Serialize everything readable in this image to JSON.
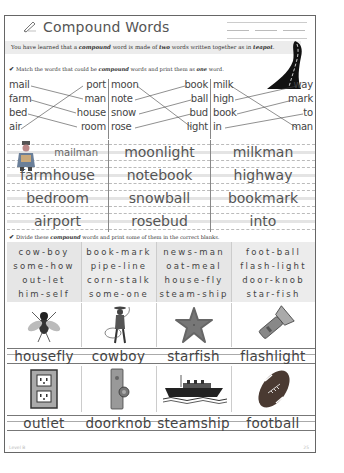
{
  "header": {
    "title": "Compound Words",
    "title_icon": "pencil-icon"
  },
  "intro": {
    "prefix": "You have learned that a ",
    "bold1": "compound",
    "middle": " word is made of ",
    "bold2": "two",
    "suffix": " words written together as in ",
    "bold3": "teapot",
    "end": "."
  },
  "instructions": {
    "match": {
      "check": "✔",
      "prefix": "Match the words that could be ",
      "bold1": "compound",
      "middle": " words and print them as ",
      "bold2": "one",
      "suffix": " word."
    },
    "divide": {
      "check": "✔",
      "prefix": "Divide these ",
      "bold1": "compound",
      "suffix": " words and print some of them in the correct blanks."
    }
  },
  "matching": {
    "columns": [
      {
        "left": [
          "mail",
          "farm",
          "bed",
          "air"
        ],
        "right": [
          "port",
          "man",
          "house",
          "room"
        ],
        "links": [
          [
            0,
            1
          ],
          [
            1,
            2
          ],
          [
            2,
            3
          ],
          [
            3,
            0
          ]
        ]
      },
      {
        "left": [
          "moon",
          "note",
          "snow",
          "rose"
        ],
        "right": [
          "book",
          "ball",
          "bud",
          "light"
        ],
        "links": [
          [
            0,
            3
          ],
          [
            1,
            0
          ],
          [
            2,
            1
          ],
          [
            3,
            2
          ]
        ]
      },
      {
        "left": [
          "milk",
          "high",
          "book",
          "in"
        ],
        "right": [
          "way",
          "mark",
          "to",
          "man"
        ],
        "links": [
          [
            0,
            3
          ],
          [
            1,
            0
          ],
          [
            2,
            1
          ],
          [
            3,
            2
          ]
        ]
      }
    ]
  },
  "answers": {
    "columns": [
      [
        "mailman",
        "farmhouse",
        "bedroom",
        "airport"
      ],
      [
        "moonlight",
        "notebook",
        "snowball",
        "rosebud"
      ],
      [
        "milkman",
        "highway",
        "bookmark",
        "into"
      ]
    ]
  },
  "divide": {
    "columns": [
      [
        "cow-boy",
        "some-how",
        "out-let",
        "him-self"
      ],
      [
        "book-mark",
        "pipe-line",
        "corn-stalk",
        "some-one"
      ],
      [
        "news-man",
        "oat-meal",
        "house-fly",
        "steam-ship"
      ],
      [
        "foot-ball",
        "flash-light",
        "door-knob",
        "star-fish"
      ]
    ]
  },
  "pictures": {
    "row1": [
      {
        "icon": "housefly-icon",
        "answer": "housefly"
      },
      {
        "icon": "cowboy-icon",
        "answer": "cowboy"
      },
      {
        "icon": "starfish-icon",
        "answer": "starfish"
      },
      {
        "icon": "flashlight-icon",
        "answer": "flashlight"
      }
    ],
    "row2": [
      {
        "icon": "outlet-icon",
        "answer": "outlet"
      },
      {
        "icon": "doorknob-icon",
        "answer": "doorknob"
      },
      {
        "icon": "steamship-icon",
        "answer": "steamship"
      },
      {
        "icon": "football-icon",
        "answer": "football"
      }
    ]
  },
  "footer": {
    "level": "Level B",
    "page": "25"
  },
  "colors": {
    "border": "#666666",
    "band": "#ececec",
    "text": "#444444"
  }
}
